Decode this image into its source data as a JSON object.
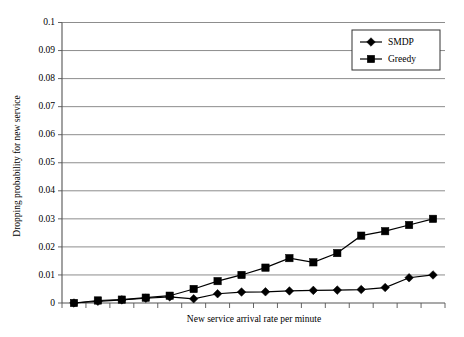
{
  "chart_data": {
    "type": "line",
    "title": "",
    "xlabel": "New service arrival rate per minute",
    "ylabel": "Dropping probability for new service",
    "ylim": [
      0,
      0.1
    ],
    "ytick_labels": [
      "0",
      "0.01",
      "0.02",
      "0.03",
      "0.04",
      "0.05",
      "0.06",
      "0.07",
      "0.08",
      "0.09",
      "0.1"
    ],
    "ytick_values": [
      0,
      0.01,
      0.02,
      0.03,
      0.04,
      0.05,
      0.06,
      0.07,
      0.08,
      0.09,
      0.1
    ],
    "xtick_labels": [],
    "x_tick_count": 16,
    "grid": "horizontal",
    "legend_position": "top-right",
    "x": [
      1,
      2,
      3,
      4,
      5,
      6,
      7,
      8,
      9,
      10,
      11,
      12,
      13,
      14,
      15,
      16
    ],
    "series": [
      {
        "name": "SMDP",
        "marker": "diamond",
        "color": "#000000",
        "values": [
          0.0,
          0.0006,
          0.0011,
          0.0017,
          0.0022,
          0.0015,
          0.0033,
          0.0039,
          0.004,
          0.0043,
          0.0045,
          0.0046,
          0.0048,
          0.0055,
          0.009,
          0.01
        ]
      },
      {
        "name": "Greedy",
        "marker": "square",
        "color": "#000000",
        "values": [
          0.0,
          0.0009,
          0.0012,
          0.0019,
          0.0026,
          0.005,
          0.0078,
          0.01,
          0.0126,
          0.016,
          0.0145,
          0.0178,
          0.024,
          0.0256,
          0.0278,
          0.03
        ]
      }
    ]
  },
  "legend": {
    "items": [
      {
        "label": "SMDP"
      },
      {
        "label": "Greedy"
      }
    ]
  },
  "axes": {
    "y_title": "Dropping probability for new service",
    "x_title": "New service arrival rate per minute"
  }
}
